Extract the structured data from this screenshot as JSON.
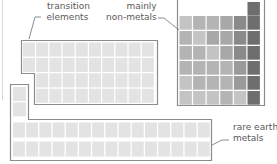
{
  "labels": {
    "transition_line1": "transition",
    "transition_line2": "elements",
    "nonmetals_line1": "mainly",
    "nonmetals_line2": "non-metals",
    "rare_line1": "rare earth",
    "rare_line2": "metals"
  },
  "colors": {
    "outline": "#8c8c8c",
    "light_cell": "#e3e3e3",
    "nonmetal_shades": [
      "#c4c4c4",
      "#b4b4b4",
      "#a8a8a8",
      "#9a9a9a",
      "#8a8a8a",
      "#6e6e6e"
    ]
  },
  "groups": {
    "transition": {
      "rows": 4,
      "cols": 10,
      "indented_rows_cols": 9
    },
    "nonmetals": {
      "rows": 6,
      "cols": 6,
      "top_extra_cells": 1
    },
    "rare_earth": {
      "rows": 2,
      "cols": 15,
      "column_stub_cells": 2
    }
  }
}
